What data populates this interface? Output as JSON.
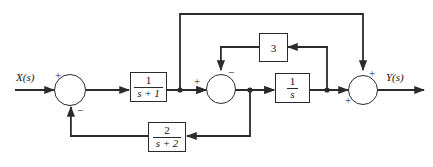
{
  "diagram": {
    "type": "control-system-block-diagram",
    "title": "",
    "line_color": "#2b2b2b",
    "background_color": "#ffffff",
    "input": {
      "label": "X(s)",
      "name": "input-signal-label"
    },
    "output": {
      "label": "Y(s)",
      "name": "output-signal-label"
    },
    "blocks": [
      {
        "id": "block-1-over-s-plus-1",
        "kind": "transfer-function",
        "numerator": "1",
        "denominator": "s + 1",
        "text": "1/(s + 1)"
      },
      {
        "id": "block-1-over-s",
        "kind": "transfer-function",
        "numerator": "1",
        "denominator": "s",
        "text": "1/s"
      },
      {
        "id": "block-gain-3",
        "kind": "gain",
        "value": "3",
        "text": "3"
      },
      {
        "id": "block-2-over-s-plus-2",
        "kind": "transfer-function",
        "numerator": "2",
        "denominator": "s + 2",
        "text": "2/(s + 2)"
      }
    ],
    "summers": [
      {
        "id": "summer-input",
        "signs": {
          "left": "+",
          "bottom": "−"
        }
      },
      {
        "id": "summer-inner",
        "signs": {
          "left": "+",
          "top": "−"
        }
      },
      {
        "id": "summer-output",
        "signs": {
          "top": "+",
          "left": "+"
        }
      }
    ],
    "signs": {
      "input_summer_plus": "+",
      "input_summer_minus": "−",
      "inner_summer_plus": "+",
      "inner_summer_minus": "−",
      "output_summer_top_plus": "+",
      "output_summer_left_plus": "+"
    }
  }
}
